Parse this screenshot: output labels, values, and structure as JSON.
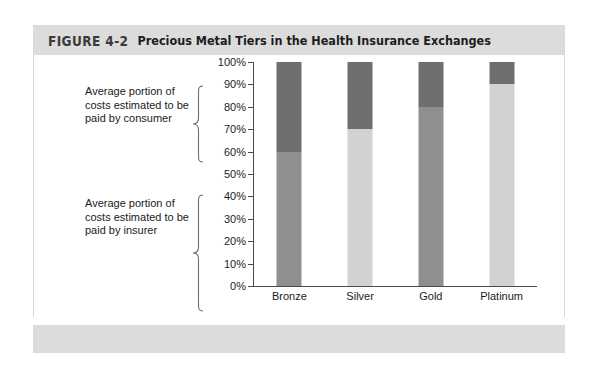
{
  "figure": {
    "number": "FIGURE 4-2",
    "title": "Precious Metal Tiers in the Health Insurance Exchanges"
  },
  "annotations": {
    "consumer": "Average portion of costs estimated to be paid by consumer",
    "insurer": "Average portion of costs estimated to be paid by insurer"
  },
  "colors": {
    "consumer_segment": "#6e6e6e",
    "insurer_segment_dark": "#8f8f8f",
    "insurer_segment_light": "#d2d2d2",
    "header_band": "#dcdcdc",
    "axis": "#4a4a4a",
    "card_border": "#d8d8d8"
  },
  "chart_data": {
    "type": "bar",
    "title": "Precious Metal Tiers in the Health Insurance Exchanges",
    "xlabel": "",
    "ylabel": "",
    "ylim": [
      0,
      100
    ],
    "grid": false,
    "legend_position": "none",
    "stacked": true,
    "stacked_total": 100,
    "categories": [
      "Bronze",
      "Silver",
      "Gold",
      "Platinum"
    ],
    "ytick_labels": [
      "100%",
      "90%",
      "80%",
      "70%",
      "60%",
      "50%",
      "40%",
      "30%",
      "20%",
      "10%",
      "0%"
    ],
    "ytick_values": [
      100,
      90,
      80,
      70,
      60,
      50,
      40,
      30,
      20,
      10,
      0
    ],
    "series": [
      {
        "name": "Average portion of costs estimated to be paid by insurer",
        "values": [
          60,
          70,
          80,
          90
        ],
        "colors": [
          "#8f8f8f",
          "#d2d2d2",
          "#8f8f8f",
          "#d2d2d2"
        ]
      },
      {
        "name": "Average portion of costs estimated to be paid by consumer",
        "values": [
          40,
          30,
          20,
          10
        ],
        "colors": [
          "#6e6e6e",
          "#6e6e6e",
          "#6e6e6e",
          "#6e6e6e"
        ]
      }
    ],
    "annotations": [
      "Average portion of costs estimated to be paid by consumer",
      "Average portion of costs estimated to be paid by insurer"
    ]
  }
}
